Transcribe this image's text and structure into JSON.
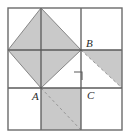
{
  "figure": {
    "colors": {
      "shade": "#c9c9c9",
      "shade_light": "#d4d4d4",
      "grid_line": "#5a5a5a",
      "outer_border": "#6b6b6b",
      "dashed_line": "#9a9a9a",
      "label_text": "#2b2b2b",
      "background": "#ffffff"
    },
    "grid": {
      "left": 8,
      "top": 8,
      "right": 122,
      "bottom": 130,
      "vertical_lines": [
        41,
        81
      ],
      "horizontal_lines": [
        50,
        88
      ]
    },
    "labels": [
      {
        "id": "label-B",
        "text": "B",
        "x": 86,
        "y": 47
      },
      {
        "id": "label-A",
        "text": "A",
        "x": 32,
        "y": 100
      },
      {
        "id": "label-C",
        "text": "C",
        "x": 87,
        "y": 99
      }
    ],
    "markers": {
      "right_angle": {
        "name": "right-angle-marker",
        "points": "74,72 82,72 82,80"
      }
    },
    "dashed_segments": [
      {
        "name": "dashed-diagonal-upper-right",
        "x1": 81,
        "y1": 50,
        "x2": 122,
        "y2": 88
      },
      {
        "name": "dashed-diagonal-lower-middle",
        "x1": 41,
        "y1": 88,
        "x2": 81,
        "y2": 130
      }
    ],
    "shaded_regions": [
      {
        "name": "diamond-inscribed",
        "points": "41,8 81,50 41,88 8,50"
      },
      {
        "name": "triangle-upper-right-cell",
        "points": "81,50 122,50 122,88"
      },
      {
        "name": "square-bottom-middle-cell",
        "points": "41,88 81,88 81,130 41,130"
      }
    ]
  }
}
